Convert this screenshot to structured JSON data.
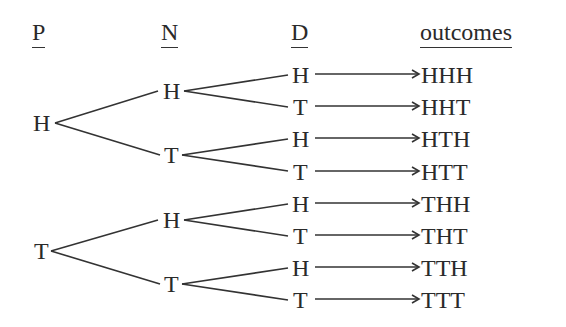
{
  "headers": {
    "p": "P",
    "n": "N",
    "d": "D",
    "outcomes": "outcomes"
  },
  "tree": {
    "level1": [
      "H",
      "T"
    ],
    "level2": [
      "H",
      "T",
      "H",
      "T"
    ],
    "level3": [
      "H",
      "T",
      "H",
      "T",
      "H",
      "T",
      "H",
      "T"
    ]
  },
  "outcomes": [
    "HHH",
    "HHT",
    "HTH",
    "HTT",
    "THH",
    "THT",
    "TTH",
    "TTT"
  ],
  "colors": {
    "ink": "#2a2a2a",
    "background": "#ffffff"
  }
}
